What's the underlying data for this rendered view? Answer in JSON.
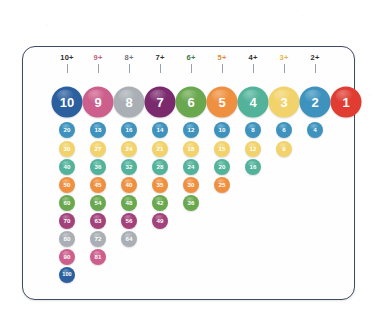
{
  "card": {
    "border_color": "#3f4a63",
    "background": "#fefefe"
  },
  "columns": [
    {
      "label": "10+",
      "color": "#2d2d2d"
    },
    {
      "label": "9+",
      "color": "#c25d7e"
    },
    {
      "label": "8+",
      "color": "#6f7480"
    },
    {
      "label": "7+",
      "color": "#2d2d2d"
    },
    {
      "label": "6+",
      "color": "#3e7a45"
    },
    {
      "label": "5+",
      "color": "#e08a3c"
    },
    {
      "label": "4+",
      "color": "#2d2d2d"
    },
    {
      "label": "3+",
      "color": "#e0b84a"
    },
    {
      "label": "2+",
      "color": "#2d2d2d"
    }
  ],
  "row_colors": {
    "1": "#2b5f9e",
    "2": "#3d93bd",
    "3": "#f2d36b",
    "4": "#52b39a",
    "5": "#ef9040",
    "6": "#6aa84f",
    "7": "#a3417a",
    "8": "#a9afb4",
    "9": "#cd5f8c",
    "10": "#2b5f9e"
  },
  "header_circle_colors": [
    "#2b5f9e",
    "#cd5f8c",
    "#a9afb4",
    "#7b2a6e",
    "#6aa84f",
    "#ef9040",
    "#52b39a",
    "#f2d36b",
    "#3d93bd",
    "#e03c31"
  ],
  "chart_data": {
    "type": "table",
    "columns": [
      "10+",
      "9+",
      "8+",
      "7+",
      "6+",
      "5+",
      "4+",
      "3+",
      "2+",
      ""
    ],
    "header_values": [
      10,
      9,
      8,
      7,
      6,
      5,
      4,
      3,
      2,
      1
    ],
    "rows": [
      {
        "multiplier": 2,
        "color": "#3d93bd",
        "values": [
          20,
          18,
          16,
          14,
          12,
          10,
          8,
          6,
          4
        ]
      },
      {
        "multiplier": 3,
        "color": "#f2d36b",
        "values": [
          30,
          27,
          24,
          21,
          18,
          15,
          12,
          9
        ]
      },
      {
        "multiplier": 4,
        "color": "#52b39a",
        "values": [
          40,
          36,
          32,
          28,
          24,
          20,
          16
        ]
      },
      {
        "multiplier": 5,
        "color": "#ef9040",
        "values": [
          50,
          45,
          40,
          35,
          30,
          25
        ]
      },
      {
        "multiplier": 6,
        "color": "#6aa84f",
        "values": [
          60,
          54,
          48,
          42,
          36
        ]
      },
      {
        "multiplier": 7,
        "color": "#a3417a",
        "values": [
          70,
          63,
          56,
          49
        ]
      },
      {
        "multiplier": 8,
        "color": "#a9afb4",
        "values": [
          80,
          72,
          64
        ]
      },
      {
        "multiplier": 9,
        "color": "#cd5f8c",
        "values": [
          90,
          81
        ]
      },
      {
        "multiplier": 10,
        "color": "#2b5f9e",
        "values": [
          100
        ]
      }
    ]
  },
  "geometry": {
    "col_x": [
      44,
      75,
      106,
      137,
      168,
      199,
      230,
      261,
      292,
      323
    ],
    "big_y": 55,
    "row_y": [
      83,
      102,
      120,
      138,
      156,
      174,
      192,
      210,
      228
    ],
    "col_step": 31
  }
}
